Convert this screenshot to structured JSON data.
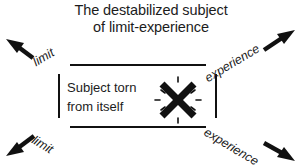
{
  "figure": {
    "title": {
      "line1": "The destabilized subject",
      "line2": "of limit-experience"
    },
    "center": {
      "line1": "Subject torn",
      "line2": "from itself",
      "symbol_name": "x-burst-icon"
    },
    "labels": {
      "top_left": "limit",
      "bottom_left": "limit",
      "top_right": "experience",
      "bottom_right": "experience"
    },
    "arrows": {
      "top_left": "arrow-up-left",
      "bottom_left": "arrow-down-left",
      "top_right": "arrow-up-right",
      "bottom_right": "arrow-down-right"
    },
    "colors": {
      "ink": "#111111",
      "text": "#1c1c1c",
      "background": "#ffffff"
    }
  }
}
